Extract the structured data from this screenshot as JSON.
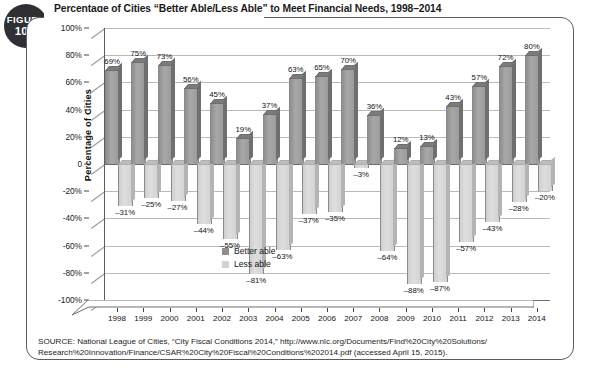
{
  "figure": {
    "badge_word": "FIGURE",
    "badge_number": "10.7",
    "title": "Percentage of Cities “Better Able/Less Able” to Meet Financial Needs, 1998–2014"
  },
  "source": {
    "line1": "SOURCE: National League of Cities, “City Fiscal Conditions 2014,” http://www.nlc.org/Documents/Find%20City%20Solutions/",
    "line2": "Research%20Innovation/Finance/CSAR%20City%20Fiscal%20Conditions%202014.pdf (accessed April 15, 2015)."
  },
  "chart_data": {
    "type": "bar",
    "title": "Percentage of Cities “Better Able/Less Able” to Meet Financial Needs, 1998–2014",
    "xlabel": "",
    "ylabel": "Percentage of Cities",
    "ylim": [
      -100,
      100
    ],
    "ytick_step": 20,
    "ytick_labels": [
      "100%",
      "80%",
      "60%",
      "40%",
      "20%",
      "0",
      "-20%",
      "-40%",
      "-60%",
      "-80%",
      "-100%"
    ],
    "ytick_values": [
      100,
      80,
      60,
      40,
      20,
      0,
      -20,
      -40,
      -60,
      -80,
      -100
    ],
    "grid": true,
    "legend_position": "inside-lower-left",
    "categories": [
      "1998",
      "1999",
      "2000",
      "2001",
      "2002",
      "2003",
      "2004",
      "2005",
      "2006",
      "2007",
      "2008",
      "2009",
      "2010",
      "2011",
      "2012",
      "2013",
      "2014"
    ],
    "series": [
      {
        "name": "Better able",
        "color": "#8f8f8f",
        "values": [
          69,
          75,
          73,
          56,
          45,
          19,
          37,
          63,
          65,
          70,
          36,
          12,
          13,
          43,
          57,
          72,
          80
        ],
        "labels": [
          "69%",
          "75%",
          "73%",
          "56%",
          "45%",
          "19%",
          "37%",
          "63%",
          "65%",
          "70%",
          "36%",
          "12%",
          "13%",
          "43%",
          "57%",
          "72%",
          "80%"
        ]
      },
      {
        "name": "Less able",
        "color": "#d2d2d2",
        "values": [
          -31,
          -25,
          -27,
          -44,
          -55,
          -81,
          -63,
          -37,
          -35,
          -3,
          -64,
          -88,
          -87,
          -57,
          -43,
          -28,
          -20
        ],
        "labels": [
          "–31%",
          "–25%",
          "–27%",
          "–44%",
          "–55%",
          "–81%",
          "–63%",
          "–37%",
          "–35%",
          "–3%",
          "–64%",
          "–88%",
          "–87%",
          "–57%",
          "–43%",
          "–28%",
          "–20%"
        ]
      }
    ]
  }
}
